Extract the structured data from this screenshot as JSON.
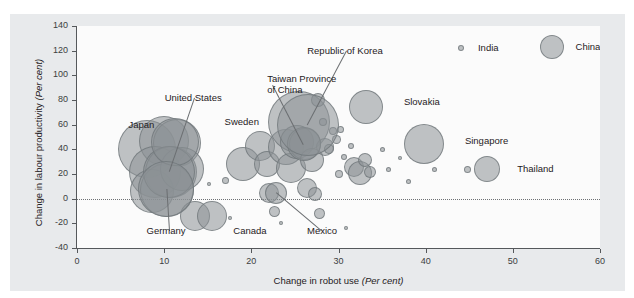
{
  "chart_data": {
    "type": "scatter",
    "title": "",
    "xlabel": "Change in robot use (Per cent)",
    "ylabel": "Change in labour productivity (Per cent)",
    "xlabel_plain": "Change in robot use",
    "xlabel_italic": "(Per cent)",
    "ylabel_plain": "Change in labour productivity",
    "ylabel_italic": "(Per cent)",
    "xlim": [
      0,
      60
    ],
    "ylim": [
      -40,
      140
    ],
    "xticks": [
      0,
      10,
      20,
      30,
      40,
      50,
      60
    ],
    "yticks": [
      140,
      120,
      100,
      80,
      60,
      40,
      20,
      0,
      -20,
      -40
    ],
    "grid": false,
    "reference_lines": [
      {
        "axis": "y",
        "value": 0,
        "style": "dotted"
      }
    ],
    "bubble_color": "#8c9296",
    "bubble_edge_color": "#6e7478",
    "size_encoding": "bubble area",
    "legend": "none",
    "labeled_points": [
      {
        "name": "Japan",
        "x": 8.0,
        "y": 40,
        "size": 58,
        "label_x": 10.5,
        "label_y": 60,
        "leader": false
      },
      {
        "name": "United States",
        "x": 10.6,
        "y": 22,
        "size": 52,
        "label_x": 13.5,
        "label_y": 82,
        "leader": true
      },
      {
        "name": "Sweden",
        "x": 11.3,
        "y": 46,
        "size": 48,
        "label_x": 19.0,
        "label_y": 62,
        "leader": false
      },
      {
        "name": "Germany",
        "x": 10.2,
        "y": 8,
        "size": 56,
        "label_x": 10.5,
        "label_y": -26,
        "leader": true
      },
      {
        "name": "Canada",
        "x": 15.5,
        "y": -14,
        "size": 30,
        "label_x": 20.0,
        "label_y": -26,
        "leader": false
      },
      {
        "name": "Taiwan Province of China",
        "x": 26.0,
        "y": 44,
        "size": 34,
        "label_x": 22.5,
        "label_y": 92,
        "leader": true
      },
      {
        "name": "Republic of Korea",
        "x": 26.5,
        "y": 60,
        "size": 62,
        "label_x": 31.0,
        "label_y": 120,
        "leader": true
      },
      {
        "name": "Mexico",
        "x": 22.8,
        "y": 5,
        "size": 22,
        "label_x": 28.0,
        "label_y": -26,
        "leader": true
      },
      {
        "name": "Slovakia",
        "x": 33.2,
        "y": 74,
        "size": 34,
        "label_x": 37.5,
        "label_y": 78,
        "leader": false
      },
      {
        "name": "Singapore",
        "x": 39.8,
        "y": 44,
        "size": 40,
        "label_x": 44.5,
        "label_y": 47,
        "leader": false
      },
      {
        "name": "Thailand",
        "x": 47.0,
        "y": 24,
        "size": 26,
        "label_x": 50.5,
        "label_y": 24,
        "leader": false
      },
      {
        "name": "India",
        "x": 44.0,
        "y": 122,
        "size": 6,
        "label_x": 46.0,
        "label_y": 122,
        "leader": false
      },
      {
        "name": "China",
        "x": 54.5,
        "y": 123,
        "size": 24,
        "label_x": 57.2,
        "label_y": 123,
        "leader": false
      }
    ],
    "unlabeled_points": [
      {
        "x": 8.0,
        "y": 40,
        "size": 58
      },
      {
        "x": 10.0,
        "y": 47,
        "size": 50
      },
      {
        "x": 11.5,
        "y": 45,
        "size": 48
      },
      {
        "x": 9.0,
        "y": 22,
        "size": 52
      },
      {
        "x": 10.8,
        "y": 22,
        "size": 52
      },
      {
        "x": 8.6,
        "y": 6,
        "size": 44
      },
      {
        "x": 10.3,
        "y": 7,
        "size": 54
      },
      {
        "x": 12.1,
        "y": 24,
        "size": 44
      },
      {
        "x": 13.5,
        "y": -14,
        "size": 30
      },
      {
        "x": 15.2,
        "y": 12,
        "size": 4
      },
      {
        "x": 17.0,
        "y": 15,
        "size": 7
      },
      {
        "x": 17.6,
        "y": -16,
        "size": 4
      },
      {
        "x": 19.0,
        "y": 28,
        "size": 34
      },
      {
        "x": 21.0,
        "y": 43,
        "size": 30
      },
      {
        "x": 21.8,
        "y": 28,
        "size": 26
      },
      {
        "x": 22.0,
        "y": 5,
        "size": 20
      },
      {
        "x": 22.7,
        "y": -10,
        "size": 11
      },
      {
        "x": 23.4,
        "y": -20,
        "size": 4
      },
      {
        "x": 24.0,
        "y": 42,
        "size": 36
      },
      {
        "x": 24.6,
        "y": 25,
        "size": 30
      },
      {
        "x": 25.5,
        "y": 62,
        "size": 62
      },
      {
        "x": 25.2,
        "y": 46,
        "size": 34
      },
      {
        "x": 26.2,
        "y": 44,
        "size": 32
      },
      {
        "x": 27.6,
        "y": 80,
        "size": 14
      },
      {
        "x": 27.0,
        "y": 31,
        "size": 24
      },
      {
        "x": 26.4,
        "y": 9,
        "size": 20
      },
      {
        "x": 27.3,
        "y": 4,
        "size": 14
      },
      {
        "x": 27.8,
        "y": -12,
        "size": 11
      },
      {
        "x": 28.2,
        "y": 62,
        "size": 8
      },
      {
        "x": 28.5,
        "y": 42,
        "size": 18
      },
      {
        "x": 28.9,
        "y": 40,
        "size": 10
      },
      {
        "x": 29.4,
        "y": 55,
        "size": 8
      },
      {
        "x": 29.8,
        "y": 48,
        "size": 9
      },
      {
        "x": 30.2,
        "y": 56,
        "size": 7
      },
      {
        "x": 30.6,
        "y": 34,
        "size": 6
      },
      {
        "x": 30.0,
        "y": 20,
        "size": 8
      },
      {
        "x": 30.9,
        "y": -24,
        "size": 4
      },
      {
        "x": 31.4,
        "y": 43,
        "size": 6
      },
      {
        "x": 31.8,
        "y": 26,
        "size": 20
      },
      {
        "x": 32.5,
        "y": 21,
        "size": 24
      },
      {
        "x": 33.0,
        "y": 31,
        "size": 14
      },
      {
        "x": 33.6,
        "y": 22,
        "size": 12
      },
      {
        "x": 33.2,
        "y": 74,
        "size": 34
      },
      {
        "x": 35.0,
        "y": 40,
        "size": 5
      },
      {
        "x": 35.7,
        "y": 24,
        "size": 5
      },
      {
        "x": 37.0,
        "y": 33,
        "size": 4
      },
      {
        "x": 38.0,
        "y": 14,
        "size": 5
      },
      {
        "x": 39.8,
        "y": 44,
        "size": 40
      },
      {
        "x": 41.0,
        "y": 24,
        "size": 5
      },
      {
        "x": 44.8,
        "y": 24,
        "size": 7
      },
      {
        "x": 44.0,
        "y": 122,
        "size": 6
      },
      {
        "x": 47.0,
        "y": 24,
        "size": 26
      },
      {
        "x": 54.5,
        "y": 123,
        "size": 24
      }
    ]
  }
}
